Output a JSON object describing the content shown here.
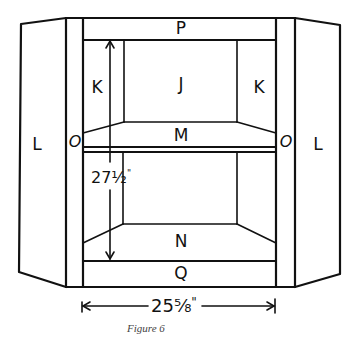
{
  "figure": {
    "caption": "Figure 6"
  },
  "labels": {
    "top_rail": "P",
    "bottom_rail": "Q",
    "back_panel": "J",
    "side_back_left": "K",
    "side_back_right": "K",
    "shelf": "M",
    "bottom_shelf": "N",
    "stile_left": "O",
    "stile_right": "O",
    "side_panel_left": "L",
    "side_panel_right": "L"
  },
  "dimensions": {
    "height": {
      "whole": "27",
      "fraction": "½",
      "unit": "\""
    },
    "width": {
      "whole": "25",
      "fraction": "⅝",
      "unit": "\""
    }
  },
  "colors": {
    "line": "#111111",
    "background": "#ffffff",
    "caption": "#444444"
  }
}
